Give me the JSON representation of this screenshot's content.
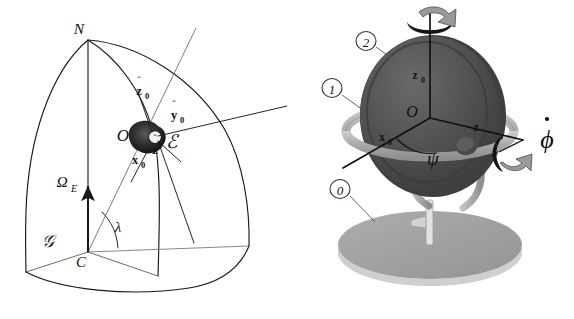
{
  "figure": {
    "background_color": "#ffffff",
    "line_color": "#1a1a1a",
    "panels": [
      {
        "id": "earth-frame-diagram",
        "position": "left"
      },
      {
        "id": "gyroscope-gimbal-diagram",
        "position": "right"
      }
    ]
  },
  "left_panel": {
    "name": "earth-frame-diagram",
    "description": "Spherical octant of the Earth with local frame vectors at point O",
    "labels": {
      "north_pole": "N",
      "center": "C",
      "origin": "O",
      "earth_rate": "Ω",
      "earth_rate_sub": "E",
      "latitude": "λ",
      "frame_g": "𝒢",
      "frame_e": "ℰ",
      "x0_hat": "x",
      "x0_hat_sub": "0",
      "y0_hat": "y",
      "y0_hat_sub": "0",
      "z0_hat": "z",
      "z0_hat_sub": "0",
      "z_hat": "z"
    },
    "hat_symbol": "ˆ"
  },
  "right_panel": {
    "name": "gyroscope-gimbal-diagram",
    "description": "Two-axis gimbal gyroscope mounted on a circular base",
    "body_numbers": [
      {
        "id": "body-2",
        "label": "2",
        "points_to": "inner-rotor-disk"
      },
      {
        "id": "body-1",
        "label": "1",
        "points_to": "outer-gimbal-ring"
      },
      {
        "id": "body-0",
        "label": "0",
        "points_to": "base-platform"
      }
    ],
    "labels": {
      "origin": "O",
      "z0_axis": "z",
      "z0_axis_sub": "0",
      "x0_axis": "x",
      "x0_axis_sub": "0",
      "z_axis": "z",
      "psi_angle": "ψ",
      "phi_rate": "ϕ"
    },
    "colors": {
      "rotor_dark": "#4a4a4a",
      "rotor_mid": "#5c5c5c",
      "ring_light": "#b9b9b9",
      "base_gray": "#9d9d9d",
      "base_rim": "#d8d8d8",
      "shadow": "#c9c9c9"
    },
    "rotation_arrows": [
      {
        "id": "spin-arrow-top",
        "axis": "vertical z0"
      },
      {
        "id": "phi-rate-arrow",
        "axis": "horizontal z"
      }
    ]
  }
}
